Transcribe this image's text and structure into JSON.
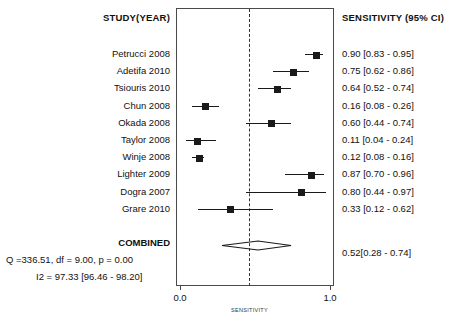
{
  "headers": {
    "study": "STUDY(YEAR)",
    "sensitivity": "SENSITIVITY (95% CI)"
  },
  "axis": {
    "title": "SENSITIVITY",
    "ticks": [
      {
        "value": 0.0,
        "label": "0.0"
      },
      {
        "value": 1.0,
        "label": "1.0"
      }
    ],
    "xmin": 0.0,
    "xmax": 1.0
  },
  "reference_line": 0.46,
  "combined": {
    "label": "COMBINED",
    "estimate_text": "0.52[0.28 - 0.74]",
    "estimate": 0.52,
    "ci_low": 0.28,
    "ci_high": 0.74
  },
  "stats": {
    "q_line": "Q =336.51, df = 9.00, p =  0.00",
    "i2_line": "I2 = 97.33 [96.46 - 98.20]"
  },
  "chart_data": {
    "type": "forest",
    "title": "",
    "xlabel": "SENSITIVITY",
    "ylabel": "",
    "xlim": [
      0.0,
      1.0
    ],
    "grid": false,
    "legend": "none",
    "columns": [
      "STUDY(YEAR)",
      "SENSITIVITY (95% CI)"
    ],
    "studies": [
      {
        "study": "Petrucci 2008",
        "estimate": 0.9,
        "ci_low": 0.83,
        "ci_high": 0.95,
        "text": "0.90 [0.83 - 0.95]"
      },
      {
        "study": "Adetifa 2010",
        "estimate": 0.75,
        "ci_low": 0.62,
        "ci_high": 0.86,
        "text": "0.75 [0.62 - 0.86]"
      },
      {
        "study": "Tsiouris 2010",
        "estimate": 0.64,
        "ci_low": 0.52,
        "ci_high": 0.74,
        "text": "0.64 [0.52 - 0.74]"
      },
      {
        "study": "Chun 2008",
        "estimate": 0.16,
        "ci_low": 0.08,
        "ci_high": 0.26,
        "text": "0.16 [0.08 - 0.26]"
      },
      {
        "study": "Okada 2008",
        "estimate": 0.6,
        "ci_low": 0.44,
        "ci_high": 0.74,
        "text": "0.60 [0.44 - 0.74]"
      },
      {
        "study": "Taylor 2008",
        "estimate": 0.11,
        "ci_low": 0.04,
        "ci_high": 0.24,
        "text": "0.11 [0.04 - 0.24]"
      },
      {
        "study": "Winje 2008",
        "estimate": 0.12,
        "ci_low": 0.08,
        "ci_high": 0.16,
        "text": "0.12 [0.08 - 0.16]"
      },
      {
        "study": "Lighter 2009",
        "estimate": 0.87,
        "ci_low": 0.7,
        "ci_high": 0.96,
        "text": "0.87 [0.70 - 0.96]"
      },
      {
        "study": "Dogra 2007",
        "estimate": 0.8,
        "ci_low": 0.44,
        "ci_high": 0.97,
        "text": "0.80 [0.44 - 0.97]"
      },
      {
        "study": "Grare 2010",
        "estimate": 0.33,
        "ci_low": 0.12,
        "ci_high": 0.62,
        "text": "0.33 [0.12 - 0.62]"
      }
    ],
    "pooled": {
      "label": "COMBINED",
      "estimate": 0.52,
      "ci_low": 0.28,
      "ci_high": 0.74,
      "text": "0.52[0.28 - 0.74]"
    },
    "heterogeneity": {
      "Q": 336.51,
      "df": 9.0,
      "p": 0.0,
      "I2": 97.33,
      "I2_ci_low": 96.46,
      "I2_ci_high": 98.2
    }
  }
}
